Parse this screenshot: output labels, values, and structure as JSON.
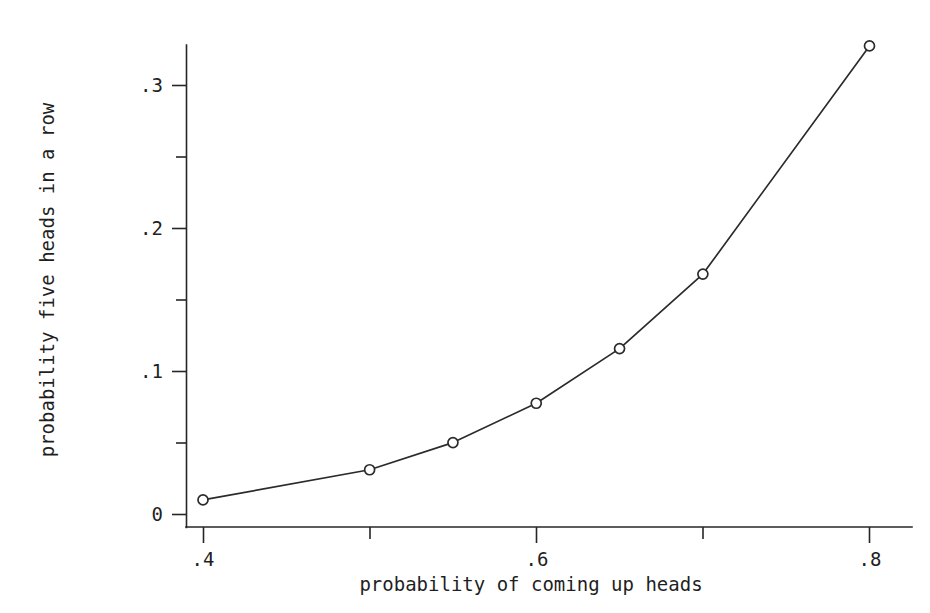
{
  "chart_data": {
    "type": "line",
    "title": "",
    "subtitle": "",
    "xlabel": "probability of coming up heads",
    "ylabel": "probability five heads in a row",
    "xlim": [
      0.375,
      0.825
    ],
    "ylim": [
      0,
      0.345
    ],
    "xticks": [
      0.4,
      0.5,
      0.6,
      0.7,
      0.8
    ],
    "xticklabels": [
      ".4",
      "",
      ".6",
      "",
      ".8"
    ],
    "yticks": [
      0,
      0.05,
      0.1,
      0.15,
      0.2,
      0.25,
      0.3
    ],
    "yticklabels": [
      "0",
      "",
      ".1",
      "",
      ".2",
      "",
      ".3"
    ],
    "grid": false,
    "legend": "none",
    "marker": "open-circle",
    "x": [
      0.4,
      0.5,
      0.55,
      0.6,
      0.65,
      0.7,
      0.8
    ],
    "values": [
      0.0102,
      0.0313,
      0.0503,
      0.0778,
      0.116,
      0.1681,
      0.3277
    ],
    "series": [
      {
        "name": "probability five heads in a row",
        "x": [
          0.4,
          0.5,
          0.55,
          0.6,
          0.65,
          0.7,
          0.8
        ],
        "values": [
          0.0102,
          0.0313,
          0.0503,
          0.0778,
          0.116,
          0.1681,
          0.3277
        ]
      }
    ],
    "line_color": "#2b2b2b",
    "marker_fill": "#ffffff",
    "background": "#ffffff"
  },
  "labels": {
    "y_tick_0": "0",
    "y_tick_1": ".1",
    "y_tick_2": ".2",
    "y_tick_3": ".3",
    "x_tick_0": ".4",
    "x_tick_1": ".6",
    "x_tick_2": ".8",
    "x_axis_title": "probability of coming up heads",
    "y_axis_title": "probability five heads in a row"
  }
}
